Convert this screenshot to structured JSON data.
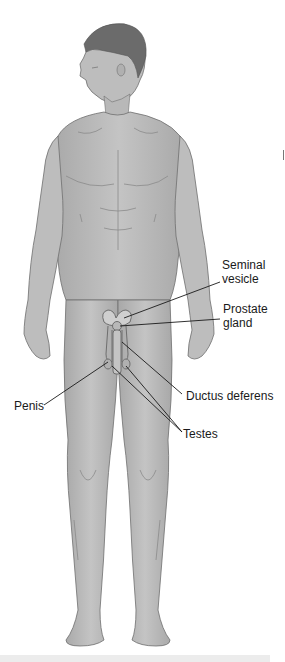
{
  "diagram": {
    "colors": {
      "skin": "#bdbdbd",
      "skin_shadow": "#9a9a9a",
      "outline": "#6e6e6e",
      "hair": "#6b6b6b",
      "leader_line": "#1a1a1a",
      "label_text": "#1a1a1a",
      "background": "#ffffff"
    },
    "labels": [
      {
        "id": "seminal-vesicle",
        "line1": "Seminal",
        "line2": "vesicle"
      },
      {
        "id": "prostate-gland",
        "line1": "Prostate",
        "line2": "gland"
      },
      {
        "id": "ductus-deferens",
        "line1": "Ductus deferens"
      },
      {
        "id": "penis",
        "line1": "Penis"
      },
      {
        "id": "testes",
        "line1": "Testes"
      }
    ]
  }
}
